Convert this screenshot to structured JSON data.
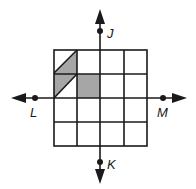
{
  "diagram": {
    "type": "coordinate-grid-reflection",
    "grid": {
      "rows": 4,
      "cols": 4,
      "line_color": "#1a1a1a"
    },
    "axes": {
      "vertical": {
        "top_label": "J",
        "bottom_label": "K"
      },
      "horizontal": {
        "left_label": "L",
        "right_label": "M"
      }
    },
    "shaded_figure": {
      "fill": "#a6a6a6",
      "description": "Parallelogram in upper-left two cells plus one full square cell"
    },
    "points": [
      {
        "name": "J",
        "position": "top of vertical line"
      },
      {
        "name": "K",
        "position": "bottom of vertical line"
      },
      {
        "name": "L",
        "position": "left of horizontal line"
      },
      {
        "name": "M",
        "position": "right of horizontal line"
      }
    ]
  }
}
